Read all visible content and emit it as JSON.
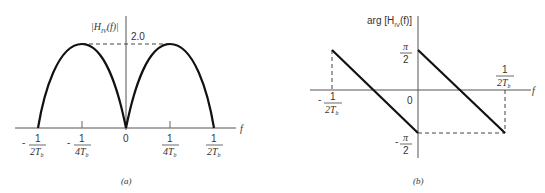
{
  "panel_a": {
    "y_axis_label": "|H_IV(f)|",
    "y_axis_label_main": "|H",
    "y_axis_label_sub": "IV",
    "y_axis_label_tail": "(f)|",
    "peak_label": "2.0",
    "x_axis_label": "f",
    "origin_label": "0",
    "ticks": [
      {
        "sign": "-",
        "num": "1",
        "den": "2T",
        "den_sub": "b"
      },
      {
        "sign": "-",
        "num": "1",
        "den": "4T",
        "den_sub": "b"
      },
      {
        "sign": "",
        "num": "1",
        "den": "4T",
        "den_sub": "b"
      },
      {
        "sign": "",
        "num": "1",
        "den": "2T",
        "den_sub": "b"
      }
    ],
    "caption": "(a)"
  },
  "panel_b": {
    "y_axis_label_pre": "arg [H",
    "y_axis_label_sub": "IV",
    "y_axis_label_tail": "(f)]",
    "x_axis_label": "f",
    "origin_label": "0",
    "pos_pi": {
      "sign": "",
      "num": "π",
      "den": "2"
    },
    "neg_pi": {
      "sign": "-",
      "num": "π",
      "den": "2"
    },
    "x_ticks": [
      {
        "sign": "-",
        "num": "1",
        "den": "2T",
        "den_sub": "b"
      },
      {
        "sign": "",
        "num": "1",
        "den": "2T",
        "den_sub": "b"
      }
    ],
    "caption": "(b)"
  }
}
